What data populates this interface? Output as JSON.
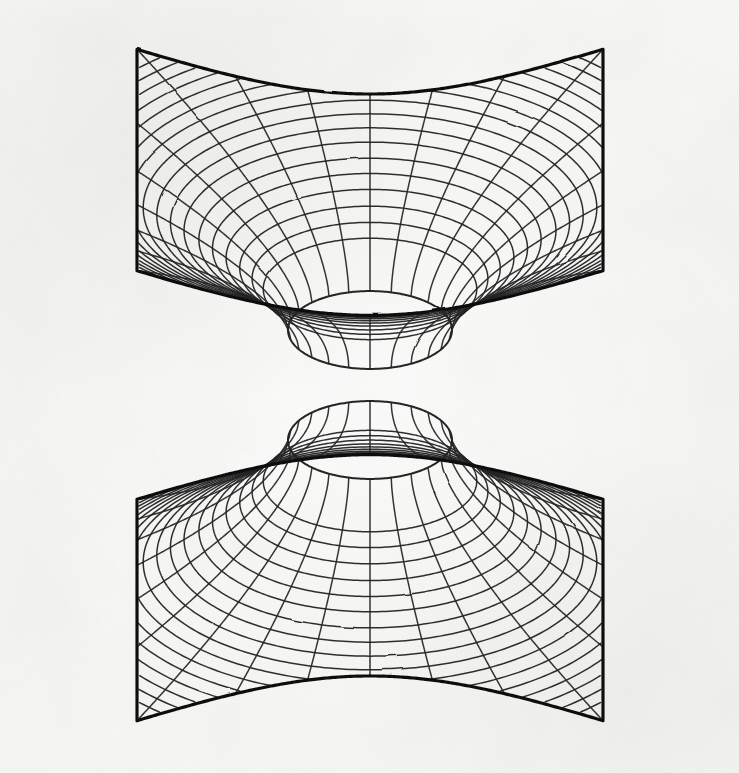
{
  "document": {
    "kind": "technical-line-drawing",
    "subject": "Two-sheeted hyperboloid of revolution rendered as a polar wireframe",
    "medium": "ink on paper, scanned",
    "caption": "",
    "title": "",
    "label": ""
  },
  "canvas": {
    "width": 739,
    "height": 773,
    "background_color": "#f7f7f5",
    "ink_color": "#252525",
    "edge_color": "#111111"
  },
  "chart_data": {
    "type": "line",
    "title": "",
    "subtitle": "",
    "xlabel": "",
    "ylabel": "",
    "legend": [],
    "grid": false,
    "surface": "hyperboloid-of-two-sheets",
    "equation": "z^2/c^2 - (x^2 + y^2)/a^2 = 1",
    "projection": {
      "center_x": 370,
      "center_y": 385,
      "throat_semi_major_px": 82,
      "throat_semi_minor_px": 39,
      "foreshorten_y": 0.475,
      "vertical_separation_px": 55,
      "flare_exponent": 1.62,
      "plane_rotation_deg": 45
    },
    "mesh": {
      "radial_spokes": 24,
      "radial_spoke_step_deg": 15,
      "concentric_rings": 18,
      "ring_radii_norm": [
        0.1,
        0.145,
        0.195,
        0.25,
        0.305,
        0.36,
        0.42,
        0.475,
        0.53,
        0.585,
        0.638,
        0.69,
        0.74,
        0.79,
        0.838,
        0.885,
        0.93,
        0.975
      ],
      "mesh_stroke_width": 1.5,
      "boundary_stroke_width": 3.2
    },
    "sheets": [
      {
        "name": "upper-sheet",
        "z_sign": 1,
        "corners_px": [
          [
            285,
            32
          ],
          [
            700,
            202
          ],
          [
            455,
            512
          ],
          [
            41,
            337
          ]
        ],
        "corner_labels": [
          "north",
          "east",
          "south",
          "west"
        ]
      },
      {
        "name": "lower-sheet",
        "z_sign": -1,
        "corners_px": [
          [
            285,
            262
          ],
          [
            703,
            430
          ],
          [
            465,
            740
          ],
          [
            41,
            566
          ]
        ],
        "corner_labels": [
          "north",
          "east",
          "south",
          "west"
        ]
      }
    ]
  }
}
